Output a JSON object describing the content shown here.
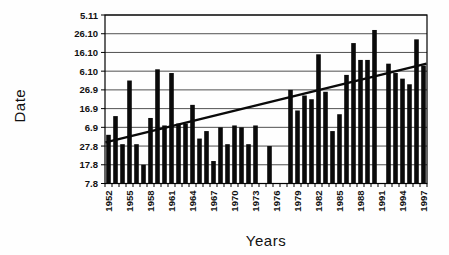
{
  "chart_data": {
    "type": "bar",
    "title": "",
    "xlabel": "Years",
    "ylabel": "Date",
    "grid": true,
    "legend": false,
    "bar_color": "#0a0a0a",
    "gridline_color": "#3c3c3c",
    "axis_color": "#000000",
    "value_unit": "days after 7 August",
    "ylim_days": [
      0,
      90
    ],
    "y_tick_step_days": 10,
    "y_tick_labels_bottom_to_top": [
      "7.8",
      "17.8",
      "27.8",
      "6.9",
      "16.9",
      "26.9",
      "6.10",
      "16.10",
      "26.10",
      "5.11"
    ],
    "x_tick_label_step_years": 3,
    "x_tick_labels_shown": [
      "1952",
      "1955",
      "1958",
      "1961",
      "1964",
      "1967",
      "1970",
      "1973",
      "1976",
      "1979",
      "1982",
      "1985",
      "1988",
      "1991",
      "1994",
      "1997"
    ],
    "years": [
      1952,
      1953,
      1954,
      1955,
      1956,
      1957,
      1958,
      1959,
      1960,
      1961,
      1962,
      1963,
      1964,
      1965,
      1966,
      1967,
      1968,
      1969,
      1970,
      1971,
      1972,
      1973,
      1974,
      1975,
      1976,
      1977,
      1978,
      1979,
      1980,
      1981,
      1982,
      1983,
      1984,
      1985,
      1986,
      1987,
      1988,
      1989,
      1990,
      1991,
      1992,
      1993,
      1994,
      1995,
      1996,
      1997
    ],
    "values_days_after_7_aug": [
      26,
      36,
      21,
      55,
      21,
      10,
      35,
      61,
      31,
      59,
      32,
      32,
      42,
      24,
      28,
      12,
      30,
      21,
      31,
      30,
      21,
      31,
      null,
      20,
      null,
      null,
      50,
      39,
      47,
      45,
      69,
      49,
      28,
      37,
      58,
      75,
      66,
      66,
      82,
      null,
      64,
      59,
      56,
      53,
      77,
      63
    ],
    "missing_years": [
      1974,
      1976,
      1977,
      1991
    ],
    "trendline": {
      "start_year": 1952,
      "end_year": 1997,
      "start_value_days": 22,
      "end_value_days": 64
    }
  }
}
